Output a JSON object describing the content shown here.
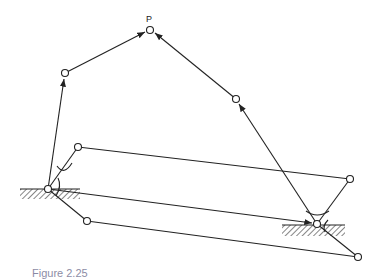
{
  "diagram": {
    "point_label": "P",
    "caption": "Figure 2.25",
    "colors": {
      "line": "#222222",
      "background": "#ffffff"
    },
    "nodes": [
      {
        "id": "P",
        "x": 150,
        "y": 30
      },
      {
        "id": "upper-left",
        "x": 65,
        "y": 73
      },
      {
        "id": "upper-right",
        "x": 236,
        "y": 99
      },
      {
        "id": "left-ground-pivot",
        "x": 48,
        "y": 189
      },
      {
        "id": "right-ground-pivot",
        "x": 317,
        "y": 224
      },
      {
        "id": "left-mid",
        "x": 78,
        "y": 147
      },
      {
        "id": "right-mid",
        "x": 350,
        "y": 179
      },
      {
        "id": "left-low",
        "x": 87,
        "y": 221
      },
      {
        "id": "right-low",
        "x": 358,
        "y": 257
      }
    ],
    "ground_supports": [
      {
        "id": "left-ground",
        "x": 20,
        "y": 189,
        "width": 60
      },
      {
        "id": "right-ground",
        "x": 282,
        "y": 225,
        "width": 63
      }
    ]
  }
}
